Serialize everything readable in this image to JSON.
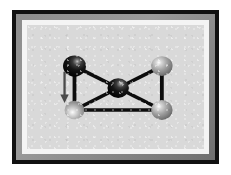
{
  "figure": {
    "title": "Graph with five spherical nodes",
    "description": "A framed illustration of an undirected graph rendered with shaded spheres as vertices and thick black bars as edges. A downward arrow on the left highlights the lower-left vertex.",
    "width": 231,
    "height": 175
  },
  "frame": {
    "outer_border_color": "#111111",
    "bevel_color": "#8d8d8d",
    "mat_color": "#f4f4f4",
    "canvas_color": "#d9d9d9",
    "outer_border_width": 4,
    "bevel_width": 6,
    "mat_width": 5
  },
  "palette": {
    "node_dark": "#101010",
    "node_dark_highlight": "#b9b9b9",
    "node_light": "#9e9e9e",
    "node_light_highlight": "#ffffff",
    "edge_color": "#0d0d0d",
    "arrow_color": "#4a4a4a"
  },
  "graph": {
    "node_count": 5,
    "edge_count": 6,
    "nodes": [
      {
        "id": "top-left",
        "label": "top-left node",
        "shade": "dark",
        "cx": 62,
        "cy": 58,
        "r": 15
      },
      {
        "id": "top-right",
        "label": "top-right node",
        "shade": "light",
        "cx": 176,
        "cy": 58,
        "r": 14
      },
      {
        "id": "center",
        "label": "center node",
        "shade": "dark",
        "cx": 119,
        "cy": 89,
        "r": 14
      },
      {
        "id": "bottom-left",
        "label": "bottom-left node",
        "shade": "light",
        "cx": 62,
        "cy": 120,
        "r": 13
      },
      {
        "id": "bottom-right",
        "label": "bottom-right node",
        "shade": "light",
        "cx": 176,
        "cy": 120,
        "r": 14
      }
    ],
    "edges": [
      {
        "id": "e1",
        "from": "top-left",
        "to": "center",
        "label": "top-left to center"
      },
      {
        "id": "e2",
        "from": "center",
        "to": "top-right",
        "label": "center to top-right"
      },
      {
        "id": "e3",
        "from": "bottom-left",
        "to": "center",
        "label": "bottom-left to center"
      },
      {
        "id": "e4",
        "from": "center",
        "to": "bottom-right",
        "label": "center to bottom-right"
      },
      {
        "id": "e5",
        "from": "top-left",
        "to": "bottom-left",
        "label": "top-left to bottom-left"
      },
      {
        "id": "e6",
        "from": "top-right",
        "to": "bottom-right",
        "label": "top-right to bottom-right"
      },
      {
        "id": "e7",
        "from": "bottom-left",
        "to": "bottom-right",
        "label": "bottom-left to bottom-right"
      }
    ],
    "edge_thickness": 5
  },
  "annotation": {
    "arrow": {
      "label": "downward arrow pointing to bottom-left node",
      "x": 49,
      "y_start": 66,
      "y_end": 110,
      "shaft_width": 3,
      "head_width": 11,
      "head_height": 12,
      "direction": "down"
    }
  }
}
